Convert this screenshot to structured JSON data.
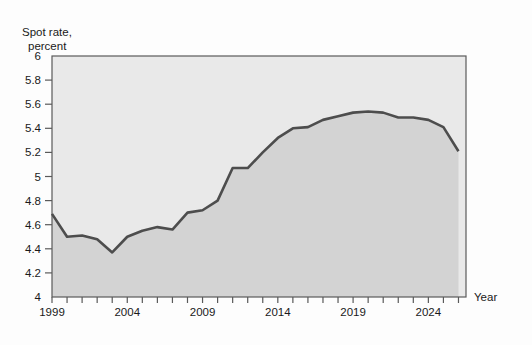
{
  "chart_data": {
    "type": "line",
    "title": "",
    "ylabel_line1": "Spot rate,",
    "ylabel_line2": "percent",
    "xlabel": "Year",
    "ylim": [
      4,
      6
    ],
    "xlim": [
      1999,
      2026.5
    ],
    "grid": false,
    "legend": "none",
    "yticks": [
      "4",
      "4.2",
      "4.4",
      "4.6",
      "4.8",
      "5",
      "5.2",
      "5.4",
      "5.6",
      "5.8",
      "6"
    ],
    "ytick_values": [
      4,
      4.2,
      4.4,
      4.6,
      4.8,
      5,
      5.2,
      5.4,
      5.6,
      5.8,
      6
    ],
    "xticks_labeled": [
      "1999",
      "2004",
      "2009",
      "2014",
      "2019",
      "2024"
    ],
    "xtick_values_labeled": [
      1999,
      2004,
      2009,
      2014,
      2019,
      2024
    ],
    "xtick_values_all": [
      1999,
      2000,
      2001,
      2002,
      2003,
      2004,
      2005,
      2006,
      2007,
      2008,
      2009,
      2010,
      2011,
      2012,
      2013,
      2014,
      2015,
      2016,
      2017,
      2018,
      2019,
      2020,
      2021,
      2022,
      2023,
      2024,
      2025,
      2026
    ],
    "series": [
      {
        "name": "Spot rate",
        "color": "#4d4d4d",
        "x": [
          1999,
          2000,
          2001,
          2002,
          2003,
          2004,
          2005,
          2006,
          2007,
          2008,
          2009,
          2010,
          2011,
          2012,
          2013,
          2014,
          2015,
          2016,
          2017,
          2018,
          2019,
          2020,
          2021,
          2022,
          2023,
          2024,
          2025,
          2026
        ],
        "values": [
          4.69,
          4.5,
          4.51,
          4.48,
          4.37,
          4.5,
          4.55,
          4.58,
          4.56,
          4.7,
          4.72,
          4.8,
          5.07,
          5.07,
          5.2,
          5.32,
          5.4,
          5.41,
          5.47,
          5.5,
          5.53,
          5.54,
          5.53,
          5.49,
          5.49,
          5.47,
          5.41,
          5.21
        ]
      }
    ]
  },
  "axes": {
    "x_axis_title": "Year",
    "y_axis_title_line1": "Spot rate,",
    "y_axis_title_line2": "percent"
  },
  "colors": {
    "line": "#4d4d4d",
    "plot_bg_lower": "#d3d3d3",
    "plot_bg_upper": "#e9e9e9",
    "frame": "#5a5a5a",
    "text": "#1a1a1a",
    "page_bg": "#fdfdfd"
  }
}
